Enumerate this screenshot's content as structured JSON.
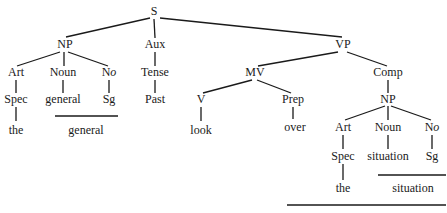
{
  "diagram": {
    "type": "syntax-tree",
    "nodes": {
      "s": {
        "label": "S",
        "x": 154,
        "y": 12
      },
      "np1": {
        "label": "NP",
        "x": 65,
        "y": 45
      },
      "aux": {
        "label": "Aux",
        "x": 155,
        "y": 45
      },
      "vp": {
        "label": "VP",
        "x": 343,
        "y": 45
      },
      "art1": {
        "label": "Art",
        "x": 16,
        "y": 73
      },
      "noun1": {
        "label": "Noun",
        "x": 63,
        "y": 73
      },
      "no1_main": "N",
      "no1_sub": "o",
      "no1": {
        "x": 109,
        "y": 73
      },
      "tense": {
        "label": "Tense",
        "x": 155,
        "y": 73
      },
      "mv": {
        "label": "MV",
        "x": 255,
        "y": 73
      },
      "comp": {
        "label": "Comp",
        "x": 388,
        "y": 73
      },
      "spec1": {
        "label": "Spec",
        "x": 16,
        "y": 100
      },
      "general1": {
        "label": "general",
        "x": 63,
        "y": 100
      },
      "sg1": {
        "label": "Sg",
        "x": 109,
        "y": 100
      },
      "past": {
        "label": "Past",
        "x": 155,
        "y": 100
      },
      "v": {
        "label": "V",
        "x": 201,
        "y": 100
      },
      "prep": {
        "label": "Prep",
        "x": 293,
        "y": 100
      },
      "np2": {
        "label": "NP",
        "x": 388,
        "y": 100
      },
      "the1": {
        "label": "the",
        "x": 16,
        "y": 131
      },
      "general2": {
        "label": "general",
        "x": 86,
        "y": 131
      },
      "look": {
        "label": "look",
        "x": 201,
        "y": 131
      },
      "over": {
        "label": "over",
        "x": 295,
        "y": 128
      },
      "art2": {
        "label": "Art",
        "x": 343,
        "y": 128
      },
      "noun2": {
        "label": "Noun",
        "x": 388,
        "y": 128
      },
      "no2": {
        "x": 432,
        "y": 128
      },
      "spec2": {
        "label": "Spec",
        "x": 343,
        "y": 157
      },
      "situation1": {
        "label": "situation",
        "x": 388,
        "y": 157
      },
      "sg2": {
        "label": "Sg",
        "x": 432,
        "y": 157
      },
      "the2": {
        "label": "the",
        "x": 343,
        "y": 189
      },
      "situation2": {
        "label": "situation",
        "x": 413,
        "y": 189
      }
    },
    "labels": {
      "S": "S",
      "NP": "NP",
      "Aux": "Aux",
      "VP": "VP",
      "Art": "Art",
      "Noun": "Noun",
      "No_N": "N",
      "No_o": "o",
      "Tense": "Tense",
      "MV": "MV",
      "Comp": "Comp",
      "Spec": "Spec",
      "general": "general",
      "Sg": "Sg",
      "Past": "Past",
      "V": "V",
      "Prep": "Prep",
      "the": "the",
      "look": "look",
      "over": "over",
      "situation": "situation"
    }
  }
}
